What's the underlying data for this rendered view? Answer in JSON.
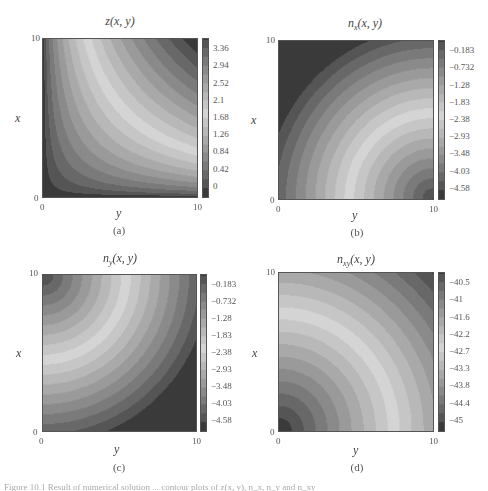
{
  "figure": {
    "caption_fragment": "Figure 10.1 Result of numerical solution ... contour plots of z(x, y), n_x, n_y and n_xy"
  },
  "chart_data": [
    {
      "type": "heatmap",
      "panel": "(a)",
      "title": "z(x, y)",
      "title_main": "z(x, y)",
      "title_sub": "",
      "xlabel": "y",
      "ylabel": "x",
      "x_ticks": [
        "0",
        "10"
      ],
      "y_ticks": [
        "0",
        "10"
      ],
      "xlim": [
        0,
        10
      ],
      "ylim": [
        0,
        10
      ],
      "colorbar_ticks": [
        "3.36",
        "2.94",
        "2.52",
        "2.1",
        "1.68",
        "1.26",
        "0.84",
        "0.42",
        "0"
      ],
      "colorbar_range": [
        0,
        3.6
      ],
      "pattern": "z",
      "box": {
        "x": 42,
        "y": 38,
        "w": 156,
        "h": 160
      },
      "cbar": {
        "x": 202,
        "y": 38,
        "w": 7,
        "h": 160
      }
    },
    {
      "type": "heatmap",
      "panel": "(b)",
      "title": "n_x(x, y)",
      "title_main": "n",
      "title_sub": "x",
      "title_rest": "(x, y)",
      "xlabel": "y",
      "ylabel": "x",
      "x_ticks": [
        "0",
        "10"
      ],
      "y_ticks": [
        "0",
        "10"
      ],
      "xlim": [
        0,
        10
      ],
      "ylim": [
        0,
        10
      ],
      "colorbar_ticks": [
        "-0.183",
        "-0.732",
        "-1.28",
        "-1.83",
        "-2.38",
        "-2.93",
        "-3.48",
        "-4.03",
        "-4.58"
      ],
      "colorbar_range": [
        -4.85,
        0.1
      ],
      "pattern": "nx",
      "box": {
        "x": 278,
        "y": 40,
        "w": 156,
        "h": 160
      },
      "cbar": {
        "x": 438,
        "y": 40,
        "w": 7,
        "h": 160
      }
    },
    {
      "type": "heatmap",
      "panel": "(c)",
      "title": "n_y(x, y)",
      "title_main": "n",
      "title_sub": "y",
      "title_rest": "(x, y)",
      "xlabel": "y",
      "ylabel": "x",
      "x_ticks": [
        "0",
        "10"
      ],
      "y_ticks": [
        "0",
        "10"
      ],
      "xlim": [
        0,
        10
      ],
      "ylim": [
        0,
        10
      ],
      "colorbar_ticks": [
        "-0.183",
        "-0.732",
        "-1.28",
        "-1.83",
        "-2.38",
        "-2.93",
        "-3.48",
        "-4.03",
        "-4.58"
      ],
      "colorbar_range": [
        -4.85,
        0.1
      ],
      "pattern": "ny",
      "box": {
        "x": 42,
        "y": 274,
        "w": 155,
        "h": 158
      },
      "cbar": {
        "x": 200,
        "y": 274,
        "w": 7,
        "h": 158
      }
    },
    {
      "type": "heatmap",
      "panel": "(d)",
      "title": "n_xy(x, y)",
      "title_main": "n",
      "title_sub": "xy",
      "title_rest": "(x, y)",
      "xlabel": "y",
      "ylabel": "x",
      "x_ticks": [
        "0",
        "10"
      ],
      "y_ticks": [
        "0",
        "10"
      ],
      "xlim": [
        0,
        10
      ],
      "ylim": [
        0,
        10
      ],
      "colorbar_ticks": [
        "-40.5",
        "-41",
        "-41.6",
        "-42.2",
        "-42.7",
        "-43.3",
        "-43.8",
        "-44.4",
        "-45"
      ],
      "colorbar_range": [
        -45.3,
        -40.2
      ],
      "pattern": "nxy",
      "box": {
        "x": 278,
        "y": 272,
        "w": 156,
        "h": 160
      },
      "cbar": {
        "x": 438,
        "y": 272,
        "w": 7,
        "h": 160
      }
    }
  ],
  "colors": {
    "dark": "#3a3a3a",
    "light": "#d4d4d4",
    "frame": "#555555",
    "background": "#ffffff"
  }
}
